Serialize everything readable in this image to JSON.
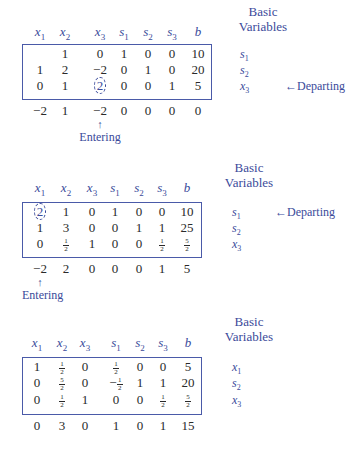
{
  "headers": [
    "x1",
    "x2",
    "x3",
    "s1",
    "s2",
    "s3",
    "b"
  ],
  "basic_title_line1": "Basic",
  "basic_title_line2": "Variables",
  "tableaus": [
    {
      "rows": [
        [
          "",
          "1",
          "0",
          "1",
          "0",
          "0",
          "10"
        ],
        [
          "1",
          "2",
          "−2",
          "0",
          "1",
          "0",
          "20"
        ],
        [
          "0",
          "1",
          "2",
          "0",
          "0",
          "1",
          "5"
        ]
      ],
      "objective": [
        "−2",
        "1",
        "−2",
        "0",
        "0",
        "0",
        "0"
      ],
      "basic_vars": [
        "s1",
        "s2",
        "x3"
      ],
      "pivot": {
        "row": 2,
        "col": 2
      },
      "departing_label": "←Departing",
      "departing_row": 2,
      "entering_label": "Entering",
      "entering_col": 2
    },
    {
      "rows": [
        [
          "2",
          "1",
          "0",
          "1",
          "0",
          "0",
          "10"
        ],
        [
          "1",
          "3",
          "0",
          "0",
          "1",
          "1",
          "25"
        ],
        [
          "0",
          "1/2",
          "1",
          "0",
          "0",
          "1/2",
          "5/2"
        ]
      ],
      "objective": [
        "−2",
        "2",
        "0",
        "0",
        "0",
        "1",
        "5"
      ],
      "basic_vars": [
        "s1",
        "s2",
        "x3"
      ],
      "pivot": {
        "row": 0,
        "col": 0
      },
      "departing_label": "←Departing",
      "departing_row": 0,
      "entering_label": "Entering",
      "entering_col": 0
    },
    {
      "rows": [
        [
          "1",
          "1/2",
          "0",
          "1/2",
          "0",
          "0",
          "5"
        ],
        [
          "0",
          "5/2",
          "0",
          "−1/2",
          "1",
          "1",
          "20"
        ],
        [
          "0",
          "1/2",
          "1",
          "0",
          "0",
          "1/2",
          "5/2"
        ]
      ],
      "objective": [
        "0",
        "3",
        "0",
        "1",
        "0",
        "1",
        "15"
      ],
      "basic_vars": [
        "x1",
        "s2",
        "x3"
      ]
    }
  ],
  "colors": {
    "accent": "#3a4a9a",
    "border": "#4a5aa8",
    "text": "#2a2a2a"
  }
}
